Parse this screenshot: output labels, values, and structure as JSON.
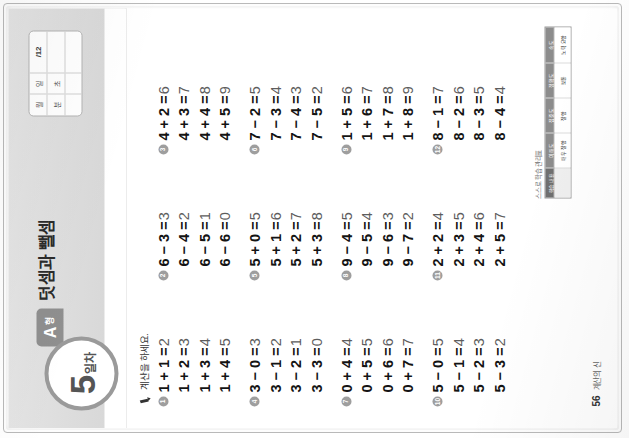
{
  "page": {
    "orientation_note": "sideways-scan",
    "chapter_title": "덧셈과 뺄셈",
    "day_number": "5",
    "day_suffix": "일차",
    "type_letter": "A",
    "type_suffix": "형",
    "instruction": "계산을 하세요."
  },
  "record_box": {
    "month_label": "월",
    "day_label": "일",
    "minute_label": "분",
    "second_label": "초",
    "score": "/12"
  },
  "problems": [
    {
      "number": "1",
      "lines": [
        {
          "expr": "1 + 1 =",
          "answer": "2"
        },
        {
          "expr": "1 + 2 =",
          "answer": "3"
        },
        {
          "expr": "1 + 3 =",
          "answer": "4"
        },
        {
          "expr": "1 + 4 =",
          "answer": "5"
        }
      ]
    },
    {
      "number": "2",
      "lines": [
        {
          "expr": "6 − 3 =",
          "answer": "3"
        },
        {
          "expr": "6 − 4 =",
          "answer": "2"
        },
        {
          "expr": "6 − 5 =",
          "answer": "1"
        },
        {
          "expr": "6 − 6 =",
          "answer": "0"
        }
      ]
    },
    {
      "number": "3",
      "lines": [
        {
          "expr": "4 + 2 =",
          "answer": "6"
        },
        {
          "expr": "4 + 3 =",
          "answer": "7"
        },
        {
          "expr": "4 + 4 =",
          "answer": "8"
        },
        {
          "expr": "4 + 5 =",
          "answer": "9"
        }
      ]
    },
    {
      "number": "4",
      "lines": [
        {
          "expr": "3 − 0 =",
          "answer": "3"
        },
        {
          "expr": "3 − 1 =",
          "answer": "2"
        },
        {
          "expr": "3 − 2 =",
          "answer": "1"
        },
        {
          "expr": "3 − 3 =",
          "answer": "0"
        }
      ]
    },
    {
      "number": "5",
      "lines": [
        {
          "expr": "5 + 0 =",
          "answer": "5"
        },
        {
          "expr": "5 + 1 =",
          "answer": "6"
        },
        {
          "expr": "5 + 2 =",
          "answer": "7"
        },
        {
          "expr": "5 + 3 =",
          "answer": "8"
        }
      ]
    },
    {
      "number": "6",
      "lines": [
        {
          "expr": "7 − 2 =",
          "answer": "5"
        },
        {
          "expr": "7 − 3 =",
          "answer": "4"
        },
        {
          "expr": "7 − 4 =",
          "answer": "3"
        },
        {
          "expr": "7 − 5 =",
          "answer": "2"
        }
      ]
    },
    {
      "number": "7",
      "lines": [
        {
          "expr": "0 + 4 =",
          "answer": "4"
        },
        {
          "expr": "0 + 5 =",
          "answer": "5"
        },
        {
          "expr": "0 + 6 =",
          "answer": "6"
        },
        {
          "expr": "0 + 7 =",
          "answer": "7"
        }
      ]
    },
    {
      "number": "8",
      "lines": [
        {
          "expr": "9 − 4 =",
          "answer": "5"
        },
        {
          "expr": "9 − 5 =",
          "answer": "4"
        },
        {
          "expr": "9 − 6 =",
          "answer": "3"
        },
        {
          "expr": "9 − 7 =",
          "answer": "2"
        }
      ]
    },
    {
      "number": "9",
      "lines": [
        {
          "expr": "1 + 5 =",
          "answer": "6"
        },
        {
          "expr": "1 + 6 =",
          "answer": "7"
        },
        {
          "expr": "1 + 7 =",
          "answer": "8"
        },
        {
          "expr": "1 + 8 =",
          "answer": "9"
        }
      ]
    },
    {
      "number": "10",
      "lines": [
        {
          "expr": "5 − 0 =",
          "answer": "5"
        },
        {
          "expr": "5 − 1 =",
          "answer": "4"
        },
        {
          "expr": "5 − 2 =",
          "answer": "3"
        },
        {
          "expr": "5 − 3 =",
          "answer": "2"
        }
      ]
    },
    {
      "number": "11",
      "lines": [
        {
          "expr": "2 + 2 =",
          "answer": "4"
        },
        {
          "expr": "2 + 3 =",
          "answer": "5"
        },
        {
          "expr": "2 + 4 =",
          "answer": "6"
        },
        {
          "expr": "2 + 5 =",
          "answer": "7"
        }
      ]
    },
    {
      "number": "12",
      "lines": [
        {
          "expr": "8 − 1 =",
          "answer": "7"
        },
        {
          "expr": "8 − 2 =",
          "answer": "6"
        },
        {
          "expr": "8 − 3 =",
          "answer": "5"
        },
        {
          "expr": "8 − 4 =",
          "answer": "4"
        }
      ]
    }
  ],
  "selfcheck": {
    "title": "스스로 학습 관리표",
    "row_label": "학습 내용",
    "columns": [
      {
        "head": "이해도",
        "cell": "매우 잘함"
      },
      {
        "head": "집중도",
        "cell": "잘함"
      },
      {
        "head": "정확도",
        "cell": "보통"
      },
      {
        "head": "속도",
        "cell": "노력 요함"
      }
    ]
  },
  "footer": {
    "page_number": "56",
    "book_name": "계산의 신"
  },
  "colors": {
    "header_band": "#dcdcdc",
    "badge_grey": "#9e9e9e",
    "tab_grey": "#8f8f8f",
    "answer_grey": "#5d5d5d"
  }
}
